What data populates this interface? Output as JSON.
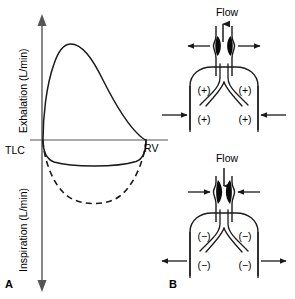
{
  "figure": {
    "panels": [
      {
        "id": "A",
        "label": "A",
        "name": "flow-volume-loop",
        "axes": {
          "y_upper_label": "Exhalation (L/min)",
          "y_lower_label": "Inspiration (L/min)",
          "x_left_label": "TLC",
          "x_right_label": "RV"
        },
        "curves": [
          {
            "name": "expiratory-limb",
            "style": "solid"
          },
          {
            "name": "inspiratory-limb-reduced",
            "style": "solid"
          },
          {
            "name": "inspiratory-limb-normal",
            "style": "dashed"
          }
        ]
      },
      {
        "id": "B",
        "label": "B",
        "name": "airway-pressure-diagrams",
        "subpanels": [
          {
            "id": "B-top",
            "name": "forced-exhalation-diagram",
            "flow_label": "Flow",
            "flow_direction": "up",
            "airway_arrows": "outward",
            "chest_arrows": "inward",
            "pressure_signs": [
              "(+)",
              "(+)",
              "(+)",
              "(+)"
            ]
          },
          {
            "id": "B-bottom",
            "name": "forced-inspiration-diagram",
            "flow_label": "Flow",
            "flow_direction": "down",
            "airway_arrows": "inward",
            "chest_arrows": "outward",
            "pressure_signs": [
              "(−)",
              "(−)",
              "(−)",
              "(−)"
            ]
          }
        ]
      }
    ],
    "colors": {
      "stroke": "#000000",
      "background": "#ffffff",
      "axis_gray": "#555555"
    }
  }
}
